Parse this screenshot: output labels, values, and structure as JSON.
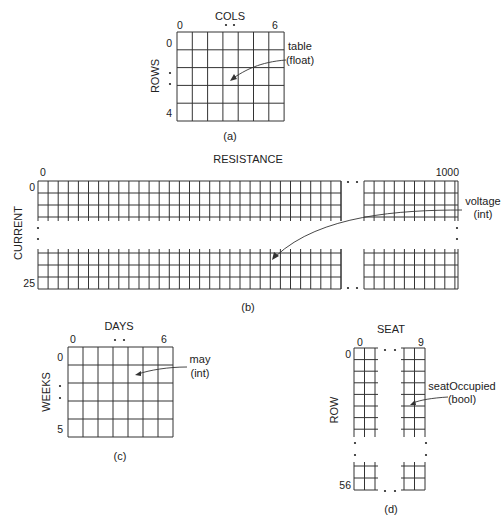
{
  "figure": {
    "a": {
      "caption": "(a)",
      "col_axis_label": "COLS",
      "row_axis_label": "ROWS",
      "col_start": "0",
      "col_end": "6",
      "row_start": "0",
      "row_end": "4",
      "array_name": "table",
      "array_type": "(float)",
      "cols": 7,
      "rows": 5
    },
    "b": {
      "caption": "(b)",
      "col_axis_label": "RESISTANCE",
      "row_axis_label": "CURRENT",
      "col_start": "0",
      "col_end": "1000",
      "row_start": "0",
      "row_end": "25",
      "array_name": "voltage",
      "array_type": "(int)"
    },
    "c": {
      "caption": "(c)",
      "col_axis_label": "DAYS",
      "row_axis_label": "WEEKS",
      "col_start": "0",
      "col_end": "6",
      "row_start": "0",
      "row_end": "5",
      "array_name": "may",
      "array_type": "(int)",
      "cols": 7,
      "rows": 5
    },
    "d": {
      "caption": "(d)",
      "col_axis_label": "SEAT",
      "row_axis_label": "ROW",
      "col_start": "0",
      "col_end": "9",
      "row_start": "0",
      "row_end": "56",
      "array_name": "seatOccupied",
      "array_type": "(bool)"
    }
  },
  "colors": {
    "line": "#333333",
    "text": "#222222",
    "background": "#ffffff"
  }
}
